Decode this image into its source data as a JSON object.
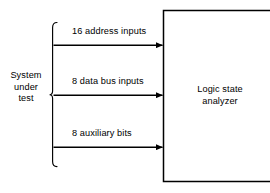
{
  "diagram": {
    "source_block": {
      "name": "system-under-test",
      "label": "System\nunder\ntest",
      "line1": "System",
      "line2": "under",
      "line3": "test"
    },
    "target_block": {
      "name": "logic-state-analyzer",
      "line1": "Logic state",
      "line2": "analyzer"
    },
    "signals": [
      {
        "id": "address",
        "label": "16 address inputs",
        "bits": 16,
        "direction": "right"
      },
      {
        "id": "data-bus",
        "label": "8 data bus inputs",
        "bits": 8,
        "direction": "right"
      },
      {
        "id": "auxiliary",
        "label": "8 auxiliary bits",
        "bits": 8,
        "direction": "right"
      }
    ],
    "colors": {
      "stroke": "#000000",
      "background": "#ffffff",
      "text": "#000000"
    }
  }
}
